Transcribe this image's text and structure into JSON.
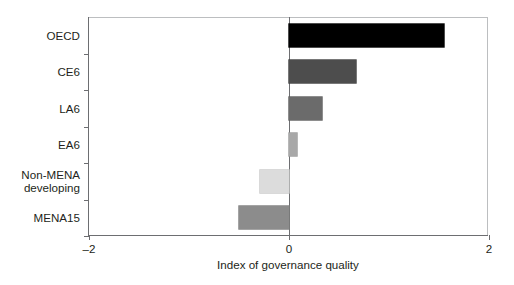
{
  "chart_data": {
    "type": "bar",
    "orientation": "horizontal",
    "title": "",
    "xlabel": "Index of governance quality",
    "ylabel": "",
    "xlim": [
      -2,
      2
    ],
    "xticks": [
      -2,
      0,
      2
    ],
    "xtick_labels": [
      "–2",
      "0",
      "2"
    ],
    "grid": false,
    "legend": "none",
    "zero_reference_line": true,
    "categories": [
      "OECD",
      "CE6",
      "LA6",
      "EA6",
      "Non-MENA\ndeveloping",
      "MENA15"
    ],
    "values": [
      1.55,
      0.67,
      0.33,
      0.08,
      -0.29,
      -0.5
    ],
    "bar_colors": [
      "#000000",
      "#4d4d4d",
      "#6b6b6b",
      "#a8a8a8",
      "#dcdcdc",
      "#8c8c8c"
    ],
    "bar_edge_colors": [
      "#000000",
      "#3f3f3f",
      "#5e5e5e",
      "#9a9a9a",
      "#c9c9c9",
      "#7e7e7e"
    ]
  },
  "axes": {
    "axis_color": "#6d6e71",
    "frame_color": "#bcbec0",
    "text_color": "#231f20"
  }
}
